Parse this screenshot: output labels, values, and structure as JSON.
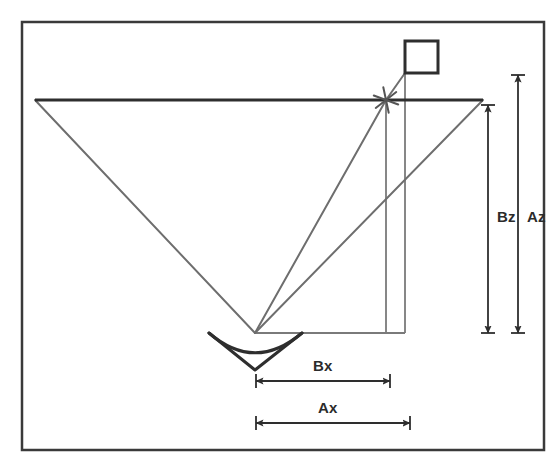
{
  "figure": {
    "kind": "geometry-diagram",
    "background_color": "#ffffff",
    "frame": {
      "name": "outer-frame",
      "stroke_color": "#3a3a3a",
      "x": 22,
      "y": 22,
      "width": 522,
      "height": 428
    },
    "colors": {
      "dark_stroke": "#333333",
      "gray_ray": "#6e6e6e",
      "label_text": "#2b2b2b"
    },
    "elements": {
      "horizontal_baseline": {
        "name": "horizontal-reference-line",
        "x1": 35,
        "y1": 100,
        "x2": 483,
        "y2": 100,
        "color": "#2e2e2e",
        "width": 3
      },
      "sensor": {
        "name": "sensor-symbol",
        "apex_x": 255,
        "apex_y": 370,
        "top_left_x": 209,
        "top_left_y": 333,
        "top_right_x": 302,
        "top_right_y": 333,
        "arc_sag": 22,
        "color": "#2e2e2e",
        "width": 3
      },
      "sensor_origin": {
        "name": "sensor-origin-point",
        "x": 255,
        "y": 333
      },
      "target_marker": {
        "name": "target-x-marker",
        "x": 386,
        "y": 100,
        "size": 13,
        "color": "#555555",
        "width": 2
      },
      "square_marker": {
        "name": "square-object-marker",
        "x": 405,
        "y": 41,
        "width": 33,
        "height": 32,
        "color": "#2e2e2e",
        "stroke_width": 3
      },
      "rays": [
        {
          "name": "ray-left-edge",
          "x1": 255,
          "y1": 333,
          "x2": 35,
          "y2": 100
        },
        {
          "name": "ray-to-target-x",
          "x1": 255,
          "y1": 333,
          "x2": 386,
          "y2": 100
        },
        {
          "name": "ray-right-edge",
          "x1": 255,
          "y1": 333,
          "x2": 483,
          "y2": 100
        },
        {
          "name": "ray-target-to-square",
          "x1": 386,
          "y1": 100,
          "x2": 405,
          "y2": 73
        }
      ],
      "projection_lines": [
        {
          "name": "vertical-projection-bz",
          "x1": 386,
          "y1": 100,
          "x2": 386,
          "y2": 333
        },
        {
          "name": "vertical-projection-az",
          "x1": 405,
          "y1": 73,
          "x2": 405,
          "y2": 333
        },
        {
          "name": "horizontal-projection-base",
          "x1": 255,
          "y1": 333,
          "x2": 405,
          "y2": 333
        }
      ]
    },
    "dimensions": [
      {
        "id": "bz",
        "label": "Bz",
        "name": "dimension-bz",
        "orientation": "vertical",
        "x": 488,
        "y_top": 105,
        "y_bottom": 333,
        "label_x": 497,
        "label_y": 209
      },
      {
        "id": "az",
        "label": "Az",
        "name": "dimension-az",
        "orientation": "vertical",
        "x": 518,
        "y_top": 75,
        "y_bottom": 333,
        "label_x": 527,
        "label_y": 209
      },
      {
        "id": "bx",
        "label": "Bx",
        "name": "dimension-bx",
        "orientation": "horizontal",
        "y": 381,
        "x_left": 256,
        "x_right": 390,
        "label_x": 313,
        "label_y": 358
      },
      {
        "id": "ax",
        "label": "Ax",
        "name": "dimension-ax",
        "orientation": "horizontal",
        "y": 423,
        "x_left": 256,
        "x_right": 410,
        "label_x": 318,
        "label_y": 400
      }
    ]
  }
}
